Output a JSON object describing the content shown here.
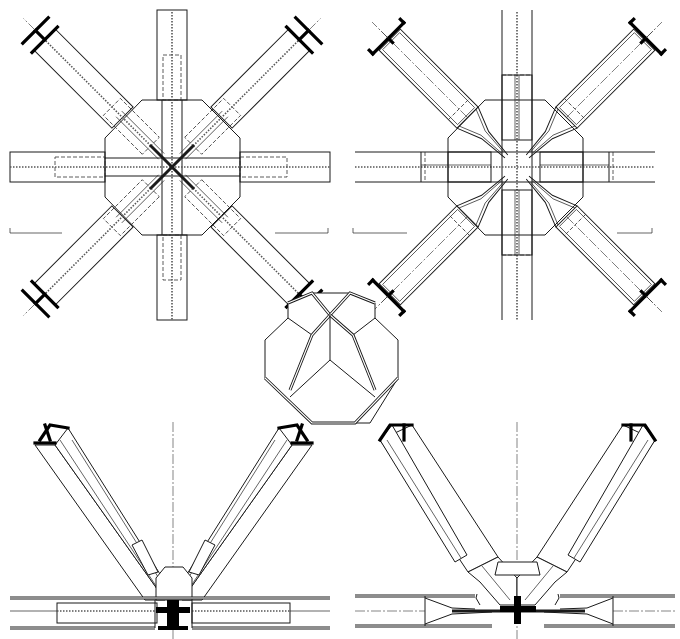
{
  "figure": {
    "type": "technical-drawing",
    "colors": {
      "line": "#1a1a1a",
      "background": "#ffffff"
    },
    "views": [
      {
        "id": "plan-bolted",
        "position": "top-left",
        "description": "plan view of octagonal gusset node with 4 orthogonal and 4 diagonal I-section members (bolted splice plates, dashed)"
      },
      {
        "id": "plan-welded",
        "position": "top-right",
        "description": "plan view of octagonal gusset node with tapered/welded diagonal member ends"
      },
      {
        "id": "node-axonometric",
        "position": "center",
        "description": "axonometric view of faceted node core"
      },
      {
        "id": "elevation-bolted",
        "position": "bottom-left",
        "description": "elevation of two inclined I-section struts meeting chord with bolted connection"
      },
      {
        "id": "elevation-welded",
        "position": "bottom-right",
        "description": "elevation of two inclined struts with tapered welded connection to chord"
      }
    ],
    "labels": []
  }
}
